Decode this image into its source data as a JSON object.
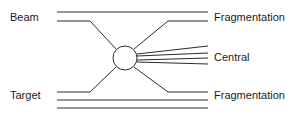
{
  "diagram": {
    "type": "collision-schematic",
    "stroke_color": "#2b2b2b",
    "text_color": "#1a1a1a",
    "background_color": "#ffffff",
    "stroke_width": 1,
    "labels": {
      "beam": "Beam",
      "target": "Target",
      "fragmentation_top": "Fragmentation",
      "central": "Central",
      "fragmentation_bottom": "Fragmentation"
    },
    "vertex": {
      "name": "interaction-vertex",
      "cx": 125,
      "cy": 58,
      "r": 12
    },
    "left_lines": {
      "beam_straight": [
        [
          57,
          12
        ],
        [
          208,
          12
        ]
      ],
      "beam_incoming": [
        [
          57,
          21
        ],
        [
          90,
          21
        ],
        [
          116,
          49
        ]
      ],
      "target_incoming": [
        [
          57,
          92
        ],
        [
          90,
          92
        ],
        [
          116,
          67
        ]
      ],
      "target_straight_1": [
        [
          57,
          100
        ],
        [
          208,
          100
        ]
      ],
      "target_straight_2": [
        [
          57,
          108
        ],
        [
          208,
          108
        ]
      ]
    },
    "right_lines": {
      "frag_top_outgoing": [
        [
          134,
          49
        ],
        [
          168,
          21
        ],
        [
          208,
          21
        ]
      ],
      "frag_bottom_outgoing": [
        [
          134,
          67
        ],
        [
          168,
          92
        ],
        [
          208,
          92
        ]
      ]
    },
    "central_fan": [
      [
        [
          137,
          54
        ],
        [
          208,
          46
        ]
      ],
      [
        [
          137,
          56
        ],
        [
          208,
          53
        ]
      ],
      [
        [
          137,
          60
        ],
        [
          208,
          58
        ]
      ],
      [
        [
          137,
          62
        ],
        [
          208,
          64
        ]
      ]
    ]
  }
}
